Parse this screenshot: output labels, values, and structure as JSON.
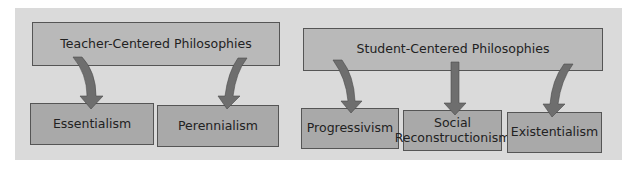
{
  "diagram": {
    "groups": [
      {
        "id": "teacher",
        "label": "Teacher-Centered Philosophies",
        "children": [
          "Essentialism",
          "Perennialism"
        ]
      },
      {
        "id": "student",
        "label": "Student-Centered Philosophies",
        "children": [
          "Progressivism",
          "Social Reconstructionism",
          "Existentialism"
        ]
      }
    ],
    "leaves": {
      "essentialism": "Essentialism",
      "perennialism": "Perennialism",
      "progressivism": "Progressivism",
      "social_line1": "Social",
      "social_line2": "Reconstructionism",
      "existentialism": "Existentialism"
    },
    "colors": {
      "background": "#dadada",
      "top_box": "#b9b9b9",
      "leaf_box": "#a9a9a9",
      "arrow": "#6e6e6e",
      "border": "#555555"
    }
  }
}
